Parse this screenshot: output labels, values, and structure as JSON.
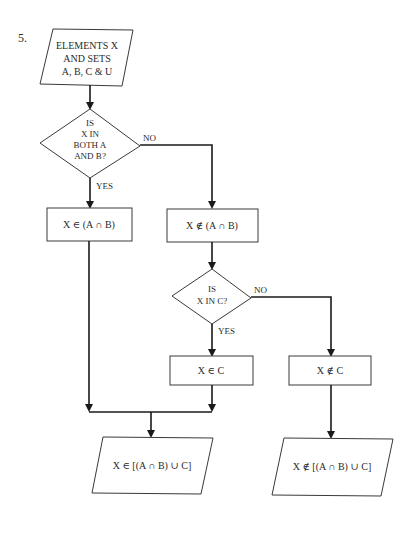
{
  "figure": {
    "number": "5.",
    "start": {
      "lines": [
        "ELEMENTS X",
        "AND SETS",
        "A, B, C & U"
      ]
    },
    "decision1": {
      "lines": [
        "IS",
        "X IN",
        "BOTH A",
        "AND B?"
      ],
      "no_label": "NO",
      "yes_label": "YES"
    },
    "process_in_ab": {
      "label": "X ∈ (A ∩ B)"
    },
    "process_not_in_ab": {
      "label": "X ∉ (A ∩ B)"
    },
    "decision2": {
      "lines": [
        "IS",
        "X IN C?"
      ],
      "no_label": "NO",
      "yes_label": "YES"
    },
    "process_in_c": {
      "label": "X ∈ C"
    },
    "process_not_in_c": {
      "label": "X ∉ C"
    },
    "output_in": {
      "label": "X ∈ [(A ∩ B) ∪ C]"
    },
    "output_not_in": {
      "label": "X ∉ [(A ∩ B) ∪ C]"
    }
  },
  "colors": {
    "ink": "#1a1a1a",
    "background": "#ffffff"
  }
}
